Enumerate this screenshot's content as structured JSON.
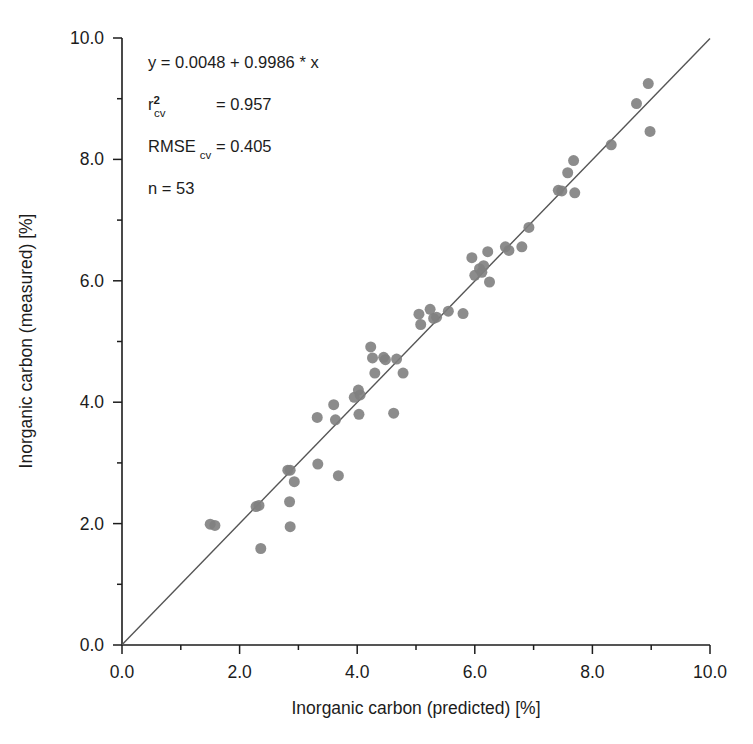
{
  "chart_data": {
    "type": "scatter",
    "title": "",
    "xlabel": "Inorganic carbon (predicted) [%]",
    "ylabel": "Inorganic carbon (measured) [%]",
    "xlim": [
      0.0,
      10.0
    ],
    "ylim": [
      0.0,
      10.0
    ],
    "xticks": [
      "0.0",
      "2.0",
      "4.0",
      "6.0",
      "8.0",
      "10.0"
    ],
    "xtick_values": [
      0.0,
      2.0,
      4.0,
      6.0,
      8.0,
      10.0
    ],
    "yticks": [
      "0.0",
      "2.0",
      "4.0",
      "6.0",
      "8.0",
      "10.0"
    ],
    "ytick_values": [
      0.0,
      2.0,
      4.0,
      6.0,
      8.0,
      10.0
    ],
    "minor_tick_step": 1.0,
    "grid": false,
    "legend": "none",
    "marker_color": "#808080",
    "marker_size": 11,
    "line_color": "#555555",
    "axis_color": "#1c1c1c",
    "fit_line": {
      "label": "1:1 / regression line",
      "intercept": 0.0048,
      "slope": 0.9986,
      "x_start": 0.0,
      "x_end": 10.0
    },
    "series": [
      {
        "name": "samples",
        "points": [
          [
            1.5,
            1.99
          ],
          [
            1.58,
            1.97
          ],
          [
            2.28,
            2.28
          ],
          [
            2.33,
            2.3
          ],
          [
            2.36,
            1.59
          ],
          [
            2.82,
            2.88
          ],
          [
            2.86,
            2.88
          ],
          [
            2.85,
            2.36
          ],
          [
            2.86,
            1.95
          ],
          [
            2.93,
            2.69
          ],
          [
            3.32,
            3.75
          ],
          [
            3.33,
            2.98
          ],
          [
            3.6,
            3.96
          ],
          [
            3.63,
            3.71
          ],
          [
            3.68,
            2.79
          ],
          [
            3.95,
            4.08
          ],
          [
            4.02,
            4.2
          ],
          [
            4.05,
            4.12
          ],
          [
            4.03,
            3.8
          ],
          [
            4.23,
            4.91
          ],
          [
            4.26,
            4.73
          ],
          [
            4.3,
            4.48
          ],
          [
            4.45,
            4.74
          ],
          [
            4.48,
            4.7
          ],
          [
            4.62,
            3.82
          ],
          [
            4.67,
            4.71
          ],
          [
            4.78,
            4.48
          ],
          [
            5.05,
            5.45
          ],
          [
            5.08,
            5.28
          ],
          [
            5.24,
            5.53
          ],
          [
            5.3,
            5.38
          ],
          [
            5.35,
            5.4
          ],
          [
            5.55,
            5.5
          ],
          [
            5.8,
            5.46
          ],
          [
            5.95,
            6.38
          ],
          [
            6.0,
            6.09
          ],
          [
            6.08,
            6.2
          ],
          [
            6.12,
            6.14
          ],
          [
            6.15,
            6.25
          ],
          [
            6.22,
            6.48
          ],
          [
            6.25,
            5.98
          ],
          [
            6.52,
            6.56
          ],
          [
            6.58,
            6.5
          ],
          [
            6.8,
            6.56
          ],
          [
            6.92,
            6.88
          ],
          [
            7.42,
            7.49
          ],
          [
            7.48,
            7.48
          ],
          [
            7.58,
            7.78
          ],
          [
            7.68,
            7.98
          ],
          [
            7.7,
            7.45
          ],
          [
            8.32,
            8.24
          ],
          [
            8.75,
            8.92
          ],
          [
            8.95,
            9.25
          ],
          [
            8.98,
            8.46
          ]
        ]
      }
    ],
    "annotations": {
      "equation": "y = 0.0048 + 0.9986 * x",
      "r2_label": "r",
      "r2_superscript": "2",
      "r2_subscript": "cv",
      "r2_value": "= 0.957",
      "rmse_label": "RMSE",
      "rmse_subscript": "cv",
      "rmse_value": "= 0.405",
      "n_text": "n = 53"
    }
  }
}
